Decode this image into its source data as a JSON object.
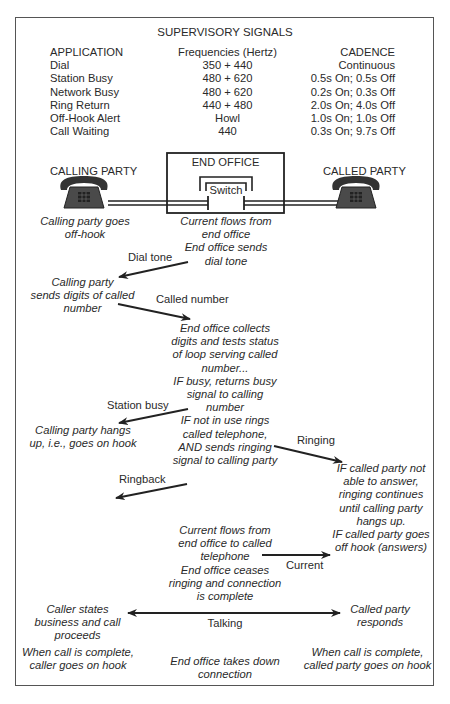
{
  "signals": {
    "title": "SUPERVISORY SIGNALS",
    "headers": {
      "application": "APPLICATION",
      "frequency": "Frequencies (Hertz)",
      "cadence": "CADENCE"
    },
    "rows": [
      {
        "application": "Dial",
        "frequency": "350 + 440",
        "cadence": "Continuous"
      },
      {
        "application": "Station Busy",
        "frequency": "480 + 620",
        "cadence": "0.5s On; 0.5s Off"
      },
      {
        "application": "Network Busy",
        "frequency": "480 + 620",
        "cadence": "0.2s On; 0.3s Off"
      },
      {
        "application": "Ring Return",
        "frequency": "440 + 480",
        "cadence": "2.0s On; 4.0s Off"
      },
      {
        "application": "Off-Hook Alert",
        "frequency": "Howl",
        "cadence": "1.0s On; 1.0s Off"
      },
      {
        "application": "Call Waiting",
        "frequency": "440",
        "cadence": "0.3s On; 9.7s Off"
      }
    ]
  },
  "diagram": {
    "calling_party": "CALLING PARTY",
    "called_party": "CALLED PARTY",
    "end_office": "END OFFICE",
    "switch": "Switch"
  },
  "flow": {
    "calling_offhook": [
      "Calling party goes",
      "off-hook"
    ],
    "current_flows": [
      "Current flows from",
      "end office",
      "End office sends",
      "dial tone"
    ],
    "dial_tone": "Dial tone",
    "sends_digits": [
      "Calling party",
      "sends digits of called",
      "number"
    ],
    "called_number": "Called number",
    "end_office_collects": [
      "End office collects",
      "digits and tests status",
      "of loop serving called",
      "number...",
      "IF busy, returns busy",
      "signal to calling",
      "number",
      "IF not in use rings",
      "called telephone,",
      "AND sends ringing",
      "signal to calling party"
    ],
    "station_busy": "Station busy",
    "hangs_up": [
      "Calling party hangs",
      "up, i.e., goes on hook"
    ],
    "ringing": "Ringing",
    "not_able": [
      "IF called party not",
      "able to answer,",
      "ringing continues",
      "until calling party",
      "hangs up.",
      "IF called party goes",
      "off hook (answers)"
    ],
    "ringback": "Ringback",
    "current_to_called": [
      "Current flows from",
      "end office to called",
      "telephone",
      "End office ceases",
      "ringing and connection",
      "is complete"
    ],
    "current": "Current",
    "caller_states": [
      "Caller states",
      "business and call",
      "proceeds"
    ],
    "talking": "Talking",
    "called_responds": [
      "Called party",
      "responds"
    ],
    "caller_onhook": [
      "When call is complete,",
      "caller goes on hook"
    ],
    "takes_down": [
      "End office takes down",
      "connection"
    ],
    "called_onhook": [
      "When call is complete,",
      "called party goes on hook"
    ]
  },
  "colors": {
    "line": "#222222",
    "text": "#2a2a2a",
    "phone_body": "#4a4a4a",
    "frame": "#555555"
  }
}
